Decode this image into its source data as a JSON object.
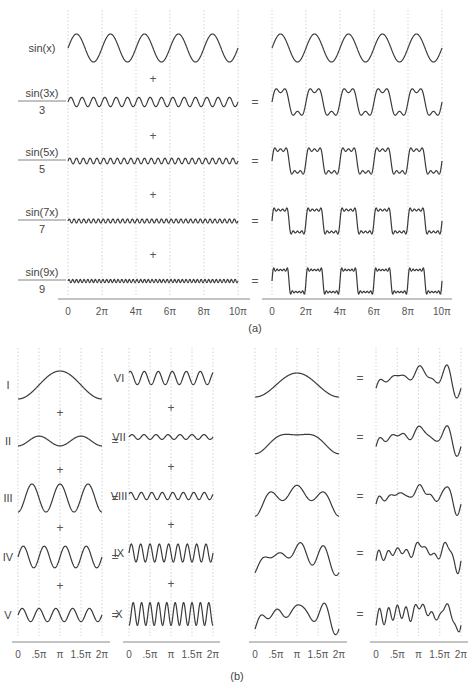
{
  "panel_a": {
    "caption": "(a)",
    "x_ticks": [
      "0",
      "2π",
      "4π",
      "6π",
      "8π",
      "10π"
    ],
    "terms": [
      {
        "label_num": "sin(x)",
        "label_den": "",
        "n": 1
      },
      {
        "label_num": "sin(3x)",
        "label_den": "3",
        "n": 3
      },
      {
        "label_num": "sin(5x)",
        "label_den": "5",
        "n": 5
      },
      {
        "label_num": "sin(7x)",
        "label_den": "7",
        "n": 7
      },
      {
        "label_num": "sin(9x)",
        "label_den": "9",
        "n": 9
      }
    ],
    "plus_sign": "+",
    "equals_sign": "="
  },
  "panel_b": {
    "caption": "(b)",
    "x_ticks": [
      "0",
      ".5π",
      "π",
      "1.5π",
      "2π"
    ],
    "components": [
      {
        "label": "I"
      },
      {
        "label": "II"
      },
      {
        "label": "III"
      },
      {
        "label": "IV"
      },
      {
        "label": "V"
      },
      {
        "label": "VI"
      },
      {
        "label": "VII"
      },
      {
        "label": "VIII"
      },
      {
        "label": "IX"
      },
      {
        "label": "X"
      }
    ],
    "plus_sign": "+",
    "equals_sign": "="
  },
  "chart_data": [
    {
      "type": "line",
      "title": "(a) Fourier synthesis of a square wave",
      "xlabel": "",
      "ylabel": "",
      "x_range": [
        0,
        "10π"
      ],
      "x_ticks": [
        "0",
        "2π",
        "4π",
        "6π",
        "8π",
        "10π"
      ],
      "grid": "vertical dotted",
      "series_left": [
        "sin(x)",
        "sin(3x)/3",
        "sin(5x)/5",
        "sin(7x)/7",
        "sin(9x)/9"
      ],
      "series_right_partial_sums": [
        "sin(x)",
        "sin(x)+sin(3x)/3",
        "sin(x)+sin(3x)/3+sin(5x)/5",
        "sin(x)+...+sin(7x)/7",
        "sin(x)+...+sin(9x)/9"
      ]
    },
    {
      "type": "line",
      "title": "(b) Sum of ten sinusoidal components",
      "xlabel": "",
      "ylabel": "",
      "x_range": [
        0,
        "2π"
      ],
      "x_ticks": [
        "0",
        ".5π",
        "π",
        "1.5π",
        "2π"
      ],
      "grid": "vertical dotted",
      "components": [
        "I",
        "II",
        "III",
        "IV",
        "V",
        "VI",
        "VII",
        "VIII",
        "IX",
        "X"
      ],
      "right_column": "running partial sums of components I through X"
    }
  ]
}
